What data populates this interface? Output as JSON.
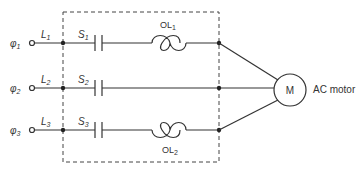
{
  "diagram": {
    "type": "three-phase motor starter circuit",
    "phases": [
      {
        "phase_symbol": "φ",
        "phase_sub": "1",
        "line_label": "L",
        "line_sub": "1",
        "switch_label": "S",
        "switch_sub": "1",
        "overload": {
          "label": "OL",
          "sub": "1"
        }
      },
      {
        "phase_symbol": "φ",
        "phase_sub": "2",
        "line_label": "L",
        "line_sub": "2",
        "switch_label": "S",
        "switch_sub": "2",
        "overload": null
      },
      {
        "phase_symbol": "φ",
        "phase_sub": "3",
        "line_label": "L",
        "line_sub": "3",
        "switch_label": "S",
        "switch_sub": "3",
        "overload": {
          "label": "OL",
          "sub": "2"
        }
      }
    ],
    "motor": {
      "symbol": "M",
      "label": "AC motor"
    },
    "colors": {
      "line": "#333333",
      "background": "#ffffff"
    }
  }
}
